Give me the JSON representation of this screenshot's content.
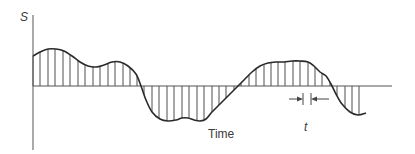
{
  "diagram": {
    "y_axis_label": "S",
    "x_axis_label": "Time",
    "interval_label": "t",
    "colors": {
      "ink": "#2a2a2a",
      "sample_lines": "#3a3a3a",
      "background": "#ffffff"
    },
    "axes": {
      "origin": [
        33,
        86
      ],
      "y_top": 15,
      "y_bottom": 150,
      "x_end": 392
    },
    "waveform_points": [
      [
        33,
        56
      ],
      [
        40,
        52
      ],
      [
        48,
        49
      ],
      [
        56,
        49
      ],
      [
        64,
        51
      ],
      [
        72,
        56
      ],
      [
        80,
        62
      ],
      [
        88,
        66
      ],
      [
        96,
        67
      ],
      [
        104,
        65
      ],
      [
        112,
        62
      ],
      [
        120,
        62
      ],
      [
        128,
        66
      ],
      [
        136,
        74
      ],
      [
        141,
        86
      ],
      [
        146,
        100
      ],
      [
        152,
        112
      ],
      [
        160,
        119
      ],
      [
        168,
        121
      ],
      [
        176,
        120
      ],
      [
        182,
        118
      ],
      [
        188,
        118
      ],
      [
        194,
        120
      ],
      [
        200,
        121
      ],
      [
        206,
        119
      ],
      [
        212,
        112
      ],
      [
        220,
        104
      ],
      [
        228,
        96
      ],
      [
        236,
        88
      ],
      [
        244,
        80
      ],
      [
        252,
        72
      ],
      [
        260,
        66
      ],
      [
        268,
        63
      ],
      [
        276,
        62
      ],
      [
        284,
        62
      ],
      [
        292,
        61
      ],
      [
        300,
        61
      ],
      [
        308,
        62
      ],
      [
        314,
        66
      ],
      [
        320,
        72
      ],
      [
        326,
        76
      ],
      [
        331,
        84
      ],
      [
        336,
        94
      ],
      [
        342,
        104
      ],
      [
        350,
        112
      ],
      [
        358,
        115
      ],
      [
        366,
        113
      ]
    ],
    "sample_x_positions": [
      33,
      40,
      48,
      55,
      63,
      70,
      78,
      85,
      93,
      100,
      108,
      115,
      123,
      130,
      137,
      144,
      152,
      159,
      167,
      174,
      182,
      189,
      197,
      204,
      212,
      219,
      226,
      234,
      241,
      249,
      256,
      264,
      271,
      278,
      285,
      293,
      300,
      308,
      315,
      322,
      330,
      337,
      345,
      352,
      359
    ],
    "interval_marker": {
      "x_left": 303,
      "x_right": 311,
      "y": 99
    }
  }
}
